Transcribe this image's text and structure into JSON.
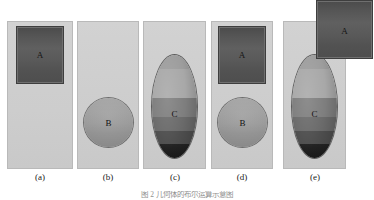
{
  "figure": {
    "caption": "图 2 几何体的布尔运算示意图",
    "background_color": "#ffffff",
    "panels": [
      {
        "id": "a",
        "label": "(a)",
        "shapes": [
          {
            "name": "A",
            "type": "square",
            "fill": "#565656"
          }
        ]
      },
      {
        "id": "b",
        "label": "(b)",
        "shapes": [
          {
            "name": "B",
            "type": "circle",
            "fill": "#989898"
          }
        ]
      },
      {
        "id": "c",
        "label": "(c)",
        "shapes": [
          {
            "name": "C",
            "type": "ellipse",
            "fill": "#7e7e7e"
          }
        ]
      },
      {
        "id": "d",
        "label": "(d)",
        "shapes": [
          {
            "name": "A",
            "type": "square",
            "fill": "#565656"
          },
          {
            "name": "B",
            "type": "circle",
            "fill": "#989898"
          }
        ]
      },
      {
        "id": "e",
        "label": "(e)",
        "shapes": [
          {
            "name": "C",
            "type": "ellipse",
            "fill": "#7e7e7e"
          },
          {
            "name": "A",
            "type": "square",
            "fill": "#565656"
          }
        ]
      }
    ],
    "colors": {
      "panel_fill": "#cfcfcf",
      "panel_border": "#b9b9b9",
      "shape_a_fill": "#565656",
      "shape_b_fill": "#989898",
      "shape_c_fill": "#7e7e7e",
      "label_text": "#1a1a1a",
      "caption_text": "#8f8f8f"
    }
  }
}
